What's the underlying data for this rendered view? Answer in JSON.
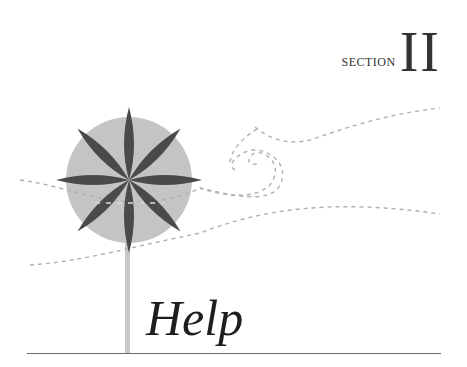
{
  "section": {
    "label": "SECTION",
    "numeral": "II"
  },
  "title": "Help",
  "icons": {
    "illustration": "pinwheel-flower-illustration"
  },
  "colors": {
    "circle": "#c4c4c4",
    "petals": "#4a4a4a",
    "stem": "#c8c8c8",
    "dashes": "#b0b0b0",
    "text": "#1e1e1e",
    "rule": "#6a6a6a"
  }
}
